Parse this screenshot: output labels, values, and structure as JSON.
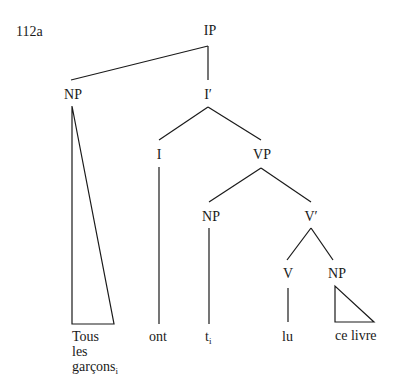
{
  "example_number": "112a",
  "nodes": {
    "ip": "IP",
    "np_subject": "NP",
    "i_bar": "I′",
    "i": "I",
    "vp": "VP",
    "np_spec_vp": "NP",
    "v_bar": "V′",
    "v": "V",
    "np_object": "NP"
  },
  "leaves": {
    "subject_line1": "Tous",
    "subject_line2": "les",
    "subject_line3": "garçons",
    "subject_index": "i",
    "aux": "ont",
    "trace": "t",
    "trace_index": "i",
    "verb": "lu",
    "object": "ce livre"
  }
}
